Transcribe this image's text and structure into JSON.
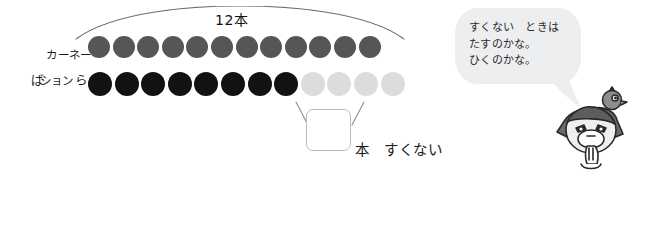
{
  "worksheet": {
    "rows": [
      {
        "label_line1": "カーネー",
        "label_line2": "ション",
        "name": "carnation",
        "total": 12,
        "filled": 12,
        "faded": 0,
        "color": "#565656"
      },
      {
        "label_line1": "ば　ら",
        "label_line2": "",
        "name": "rose",
        "total": 12,
        "filled": 8,
        "faded": 4,
        "color": "#121212",
        "faded_color": "#dcdcdc"
      }
    ],
    "bracket_label": "12本",
    "difference": {
      "box_value": "",
      "unit_text": "本　すくない"
    },
    "speech": {
      "text": "すくない　ときは\nたすのかな。\nひくのかな。",
      "bubble_color": "#eceef0"
    },
    "equation": {
      "label": "しき",
      "box1_value": "",
      "paren_open": "(",
      "paren_close": ")",
      "box2_value": "",
      "equals": "=",
      "box3_value": ""
    },
    "answer": {
      "label": "こたえ",
      "paren_open": "(",
      "value": "",
      "paren_close": ")",
      "unit": "本"
    },
    "icons": {
      "mascot": "bird-mascot-thinking-icon",
      "arc": "span-arc-icon",
      "bracket": "difference-bracket-icon",
      "tail": "speech-bubble-tail-icon"
    }
  }
}
